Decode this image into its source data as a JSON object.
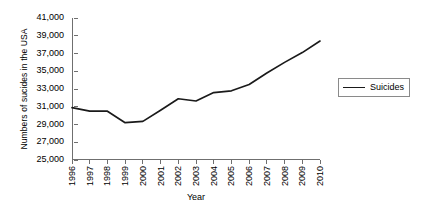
{
  "chart_data": {
    "type": "line",
    "title": "",
    "xlabel": "Year",
    "ylabel": "Numbers of sucides in the USA",
    "categories": [
      "1996",
      "1997",
      "1998",
      "1999",
      "2000",
      "2001",
      "2002",
      "2003",
      "2004",
      "2005",
      "2006",
      "2007",
      "2008",
      "2009",
      "2010"
    ],
    "series": [
      {
        "name": "Suicides",
        "values": [
          30900,
          30500,
          30500,
          29200,
          29350,
          30600,
          31900,
          31650,
          32600,
          32800,
          33500,
          34800,
          36000,
          37100,
          38400
        ]
      }
    ],
    "ylim": [
      25000,
      41000
    ],
    "ytick_step": 2000,
    "ytick_labels": [
      "25,000",
      "27,000",
      "29,000",
      "31,000",
      "33,000",
      "35,000",
      "37,000",
      "39,000",
      "41,000"
    ],
    "ytick_values": [
      25000,
      27000,
      29000,
      31000,
      33000,
      35000,
      37000,
      39000,
      41000
    ],
    "grid": false,
    "legend_position": "right",
    "line_color": "#1a1a1a",
    "axis_color": "#6f6f6f"
  },
  "legend": {
    "entries": [
      {
        "label": "Suicides"
      }
    ]
  }
}
